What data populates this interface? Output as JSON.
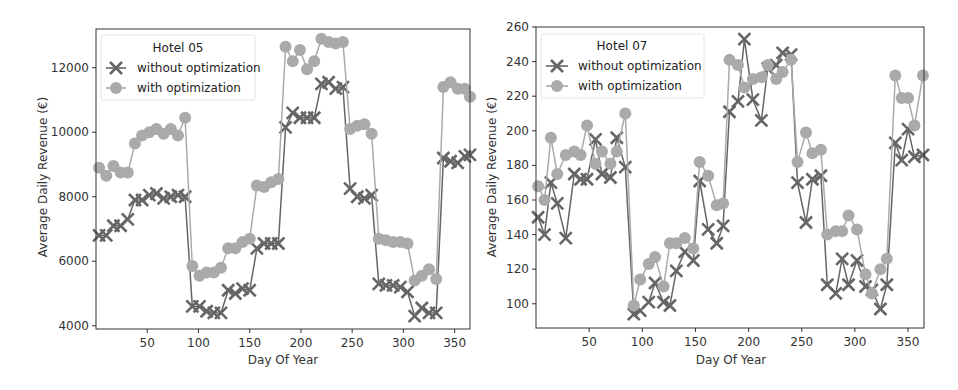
{
  "chart_data": [
    {
      "type": "line",
      "title": "Hotel 05",
      "xlabel": "Day Of Year",
      "ylabel": "Average Daily Revenue (€)",
      "xlim": [
        0,
        365
      ],
      "ylim": [
        3900,
        13200
      ],
      "xticks": [
        50,
        100,
        150,
        200,
        250,
        300,
        350
      ],
      "yticks": [
        4000,
        6000,
        8000,
        10000,
        12000
      ],
      "grid": false,
      "legend_position": "upper left",
      "legend_title": "Hotel 05",
      "series": [
        {
          "name": "without optimization",
          "marker": "x",
          "color": "#666666",
          "x": [
            3,
            10,
            17,
            24,
            31,
            38,
            45,
            52,
            59,
            66,
            73,
            80,
            87,
            94,
            101,
            108,
            115,
            122,
            129,
            136,
            143,
            150,
            157,
            164,
            171,
            178,
            185,
            192,
            199,
            206,
            213,
            220,
            227,
            234,
            241,
            248,
            255,
            262,
            269,
            276,
            283,
            290,
            297,
            304,
            311,
            318,
            325,
            332,
            339,
            346,
            353,
            360,
            365
          ],
          "values": [
            6800,
            6800,
            7100,
            7100,
            7300,
            7900,
            7900,
            8050,
            8100,
            7950,
            8000,
            8050,
            8000,
            4600,
            4600,
            4450,
            4400,
            4400,
            5100,
            5000,
            5150,
            5100,
            6400,
            6550,
            6550,
            6550,
            10150,
            10600,
            10450,
            10450,
            10450,
            11500,
            11550,
            11350,
            11400,
            8250,
            8000,
            7950,
            8050,
            5300,
            5250,
            5250,
            5200,
            5050,
            4300,
            4550,
            4400,
            4400,
            9200,
            9100,
            9050,
            9250,
            9300
          ]
        },
        {
          "name": "with optimization",
          "marker": "o",
          "color": "#aaaaaa",
          "x": [
            3,
            10,
            17,
            24,
            31,
            38,
            45,
            52,
            59,
            66,
            73,
            80,
            87,
            94,
            101,
            108,
            115,
            122,
            129,
            136,
            143,
            150,
            157,
            164,
            171,
            178,
            185,
            192,
            199,
            206,
            213,
            220,
            227,
            234,
            241,
            248,
            255,
            262,
            269,
            276,
            283,
            290,
            297,
            304,
            311,
            318,
            325,
            332,
            339,
            346,
            353,
            360,
            365
          ],
          "values": [
            8900,
            8650,
            8950,
            8750,
            8750,
            9650,
            9900,
            10000,
            10100,
            9950,
            10100,
            9900,
            10450,
            5850,
            5550,
            5650,
            5650,
            5800,
            6400,
            6400,
            6600,
            6700,
            8350,
            8300,
            8450,
            8550,
            12650,
            12200,
            12550,
            11950,
            12200,
            12900,
            12800,
            12750,
            12800,
            10100,
            10200,
            10250,
            9950,
            6700,
            6650,
            6600,
            6600,
            6550,
            5400,
            5550,
            5750,
            5450,
            11400,
            11550,
            11350,
            11350,
            11100
          ]
        }
      ]
    },
    {
      "type": "line",
      "title": "Hotel 07",
      "xlabel": "Day Of Year",
      "ylabel": "Average Daily Revenue (€)",
      "xlim": [
        0,
        365
      ],
      "ylim": [
        86,
        260
      ],
      "xticks": [
        50,
        100,
        150,
        200,
        250,
        300,
        350
      ],
      "yticks": [
        100,
        120,
        140,
        160,
        180,
        200,
        220,
        240,
        260
      ],
      "grid": false,
      "legend_position": "upper left",
      "legend_title": "Hotel 07",
      "series": [
        {
          "name": "without optimization",
          "marker": "x",
          "color": "#666666",
          "x": [
            2,
            8,
            14,
            20,
            28,
            36,
            42,
            48,
            56,
            62,
            70,
            76,
            84,
            92,
            98,
            106,
            112,
            120,
            126,
            132,
            140,
            148,
            154,
            162,
            170,
            176,
            182,
            190,
            196,
            204,
            212,
            218,
            226,
            232,
            240,
            246,
            254,
            260,
            268,
            274,
            282,
            288,
            294,
            302,
            310,
            316,
            324,
            330,
            338,
            344,
            350,
            356,
            364
          ],
          "values": [
            150,
            140,
            170,
            158,
            138,
            175,
            172,
            172,
            195,
            175,
            173,
            196,
            179,
            94,
            96,
            101,
            112,
            101,
            99,
            119,
            130,
            125,
            171,
            143,
            135,
            145,
            211,
            217,
            253,
            218,
            206,
            236,
            238,
            245,
            244,
            170,
            147,
            172,
            174,
            111,
            106,
            126,
            111,
            125,
            110,
            108,
            97,
            111,
            193,
            183,
            201,
            185,
            186
          ]
        },
        {
          "name": "with optimization",
          "marker": "o",
          "color": "#aaaaaa",
          "x": [
            2,
            8,
            14,
            20,
            28,
            36,
            42,
            48,
            56,
            62,
            70,
            76,
            84,
            92,
            98,
            106,
            112,
            120,
            126,
            132,
            140,
            148,
            154,
            162,
            170,
            176,
            182,
            190,
            196,
            204,
            212,
            218,
            226,
            232,
            240,
            246,
            254,
            260,
            268,
            274,
            282,
            288,
            294,
            302,
            310,
            316,
            324,
            330,
            338,
            344,
            350,
            356,
            364
          ],
          "values": [
            168,
            160,
            196,
            175,
            186,
            188,
            186,
            203,
            181,
            188,
            181,
            188,
            210,
            99,
            114,
            123,
            127,
            110,
            135,
            135,
            138,
            132,
            182,
            174,
            157,
            158,
            241,
            238,
            225,
            230,
            231,
            238,
            230,
            234,
            241,
            182,
            199,
            187,
            189,
            140,
            142,
            142,
            151,
            143,
            117,
            106,
            120,
            126,
            232,
            219,
            219,
            203,
            232
          ]
        }
      ]
    }
  ],
  "charts": {
    "left": {
      "legend_title": "Hotel 05",
      "legend_without": "without optimization",
      "legend_with": "with optimization",
      "xlabel": "Day Of Year",
      "ylabel": "Average Daily Revenue (€)"
    },
    "right": {
      "legend_title": "Hotel 07",
      "legend_without": "without optimization",
      "legend_with": "with optimization",
      "xlabel": "Day Of Year",
      "ylabel": "Average Daily Revenue (€)"
    }
  }
}
